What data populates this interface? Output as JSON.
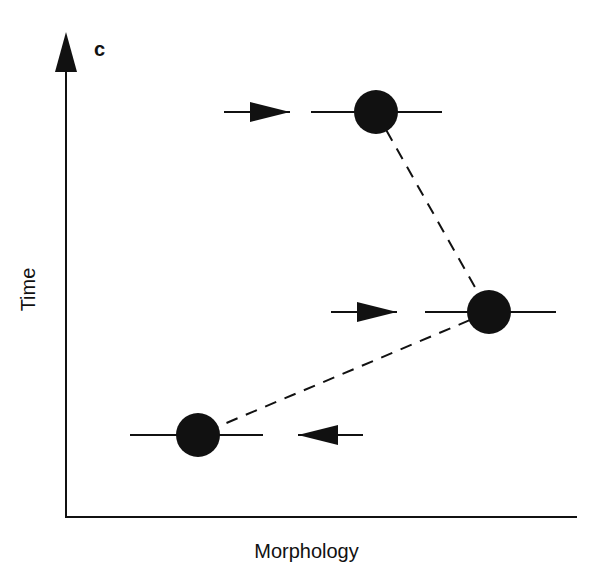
{
  "panel_label": "C",
  "axes": {
    "x_label": "Morphology",
    "y_label": "Time"
  },
  "nodes": [
    {
      "id": "top",
      "cx": 376,
      "cy": 112,
      "r": 22,
      "line_from": 311,
      "line_to": 442,
      "arrow": {
        "direction": "right",
        "x1": 224,
        "x2": 290,
        "y": 112
      }
    },
    {
      "id": "middle",
      "cx": 489,
      "cy": 312,
      "r": 22,
      "line_from": 425,
      "line_to": 556,
      "arrow": {
        "direction": "right",
        "x1": 331,
        "x2": 397,
        "y": 312
      }
    },
    {
      "id": "bottom",
      "cx": 198,
      "cy": 435,
      "r": 22,
      "line_from": 130,
      "line_to": 263,
      "arrow": {
        "direction": "left",
        "x1": 298,
        "x2": 363,
        "y": 435
      }
    }
  ],
  "dashed_links": [
    {
      "from": "top",
      "to": "middle"
    },
    {
      "from": "middle",
      "to": "bottom"
    }
  ],
  "colors": {
    "ink": "#111111",
    "background": "#ffffff"
  }
}
